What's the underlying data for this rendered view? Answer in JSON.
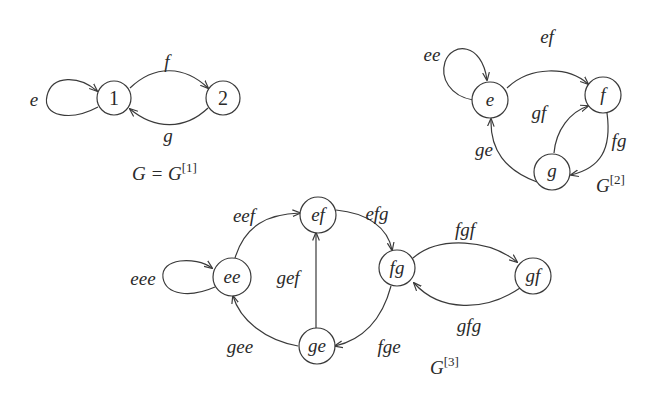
{
  "graphs": [
    {
      "id": "G1",
      "caption": {
        "main": "G = G",
        "sup": "[1]"
      },
      "nodes": [
        {
          "id": "1",
          "label": "1"
        },
        {
          "id": "2",
          "label": "2"
        }
      ],
      "edges": [
        {
          "from": "1",
          "to": "1",
          "label": "e"
        },
        {
          "from": "1",
          "to": "2",
          "label": "f"
        },
        {
          "from": "2",
          "to": "1",
          "label": "g"
        }
      ]
    },
    {
      "id": "G2",
      "caption": {
        "main": "G",
        "sup": "[2]"
      },
      "nodes": [
        {
          "id": "e",
          "label": "e"
        },
        {
          "id": "f",
          "label": "f"
        },
        {
          "id": "g",
          "label": "g"
        }
      ],
      "edges": [
        {
          "from": "e",
          "to": "e",
          "label": "ee"
        },
        {
          "from": "e",
          "to": "f",
          "label": "ef"
        },
        {
          "from": "g",
          "to": "f",
          "label": "gf"
        },
        {
          "from": "g",
          "to": "e",
          "label": "ge"
        },
        {
          "from": "f",
          "to": "g",
          "label": "fg"
        }
      ]
    },
    {
      "id": "G3",
      "caption": {
        "main": "G",
        "sup": "[3]"
      },
      "nodes": [
        {
          "id": "ee",
          "label": "ee"
        },
        {
          "id": "ef",
          "label": "ef"
        },
        {
          "id": "fg",
          "label": "fg"
        },
        {
          "id": "ge",
          "label": "ge"
        },
        {
          "id": "gf",
          "label": "gf"
        }
      ],
      "edges": [
        {
          "from": "ee",
          "to": "ee",
          "label": "eee"
        },
        {
          "from": "ee",
          "to": "ef",
          "label": "eef"
        },
        {
          "from": "ef",
          "to": "fg",
          "label": "efg"
        },
        {
          "from": "ge",
          "to": "ef",
          "label": "gef"
        },
        {
          "from": "ge",
          "to": "ee",
          "label": "gee"
        },
        {
          "from": "fg",
          "to": "ge",
          "label": "fge"
        },
        {
          "from": "fg",
          "to": "gf",
          "label": "fgf"
        },
        {
          "from": "gf",
          "to": "fg",
          "label": "gfg"
        }
      ]
    }
  ]
}
